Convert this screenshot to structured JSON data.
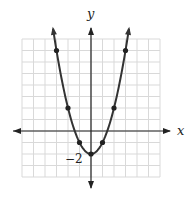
{
  "chart_data": {
    "type": "line",
    "title": "",
    "xlabel": "x",
    "ylabel": "y",
    "function": "y = x^2 - 2",
    "xlim": [
      -6,
      6
    ],
    "ylim": [
      -4,
      8
    ],
    "grid": true,
    "grid_step": 1,
    "tick_labels": [
      {
        "axis": "y",
        "value": -2,
        "text": "−2"
      }
    ],
    "points": [
      {
        "x": -3,
        "y": 7
      },
      {
        "x": -2,
        "y": 2
      },
      {
        "x": -1,
        "y": -1
      },
      {
        "x": 0,
        "y": -2
      },
      {
        "x": 1,
        "y": -1
      },
      {
        "x": 2,
        "y": 2
      },
      {
        "x": 3,
        "y": 7
      }
    ],
    "curve_range": [
      -3.3,
      3.3
    ],
    "colors": {
      "grid": "#d9d9d9",
      "axis": "#222222",
      "curve": "#333333"
    }
  }
}
